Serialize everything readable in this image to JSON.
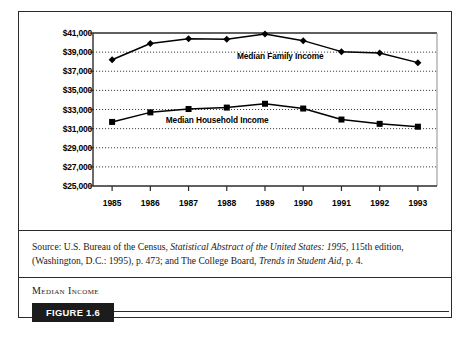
{
  "figure": {
    "caption_title": "Median Income",
    "badge_label": "FIGURE 1.6",
    "source_prefix": "Source: U.S. Bureau of the Census, ",
    "source_italic_1": "Statistical Abstract of the United States: 1995",
    "source_mid": ", 115th edition, (Washington, D.C.: 1995), p. 473; and The College Board, ",
    "source_italic_2": "Trends in Student Aid",
    "source_suffix": ", p. 4."
  },
  "chart_data": {
    "type": "line",
    "title": "Median Income",
    "xlabel": "",
    "ylabel": "",
    "x": [
      1985,
      1986,
      1987,
      1988,
      1989,
      1990,
      1991,
      1992,
      1993
    ],
    "categories": [
      "1985",
      "1986",
      "1987",
      "1988",
      "1989",
      "1990",
      "1991",
      "1992",
      "1993"
    ],
    "ylim": [
      25000,
      41000
    ],
    "ytick_step": 2000,
    "ytick_labels": [
      "$41,000",
      "$39,000",
      "$37,000",
      "$35,000",
      "$33,000",
      "$31,000",
      "$29,000",
      "$27,000",
      "$25,000"
    ],
    "ytick_values": [
      41000,
      39000,
      37000,
      35000,
      33000,
      31000,
      29000,
      27000,
      25000
    ],
    "grid": true,
    "grid_style": "dotted",
    "legend_position": "inline-annotation",
    "series": [
      {
        "name": "Median Family Income",
        "marker": "diamond",
        "color": "#000000",
        "values": [
          38200,
          39900,
          40400,
          40350,
          40900,
          40200,
          39050,
          38900,
          37900
        ],
        "label_x": 1989.4,
        "label_y": 38550
      },
      {
        "name": "Median Household Income",
        "marker": "square",
        "color": "#000000",
        "values": [
          31700,
          32700,
          33050,
          33200,
          33600,
          33100,
          31950,
          31500,
          31200
        ],
        "label_x": 1987.75,
        "label_y": 31850
      }
    ]
  }
}
